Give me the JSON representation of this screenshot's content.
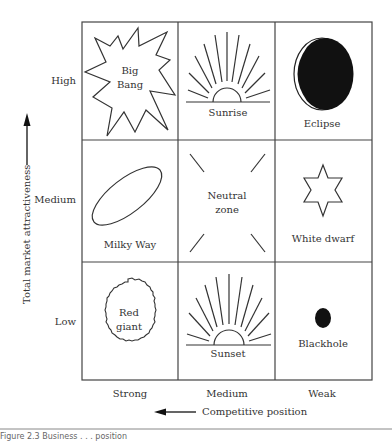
{
  "diagram": {
    "y_axis": {
      "title": "Total market attractiveness",
      "levels": [
        "High",
        "Medium",
        "Low"
      ]
    },
    "x_axis": {
      "title": "Competitive position",
      "levels": [
        "Strong",
        "Medium",
        "Weak"
      ]
    },
    "cells": [
      {
        "row": "High",
        "col": "Strong",
        "label_line1": "Big",
        "label_line2": "Bang",
        "icon": "starburst-icon"
      },
      {
        "row": "High",
        "col": "Medium",
        "label": "Sunrise",
        "icon": "sunrise-icon"
      },
      {
        "row": "High",
        "col": "Weak",
        "label": "Eclipse",
        "icon": "eclipse-icon"
      },
      {
        "row": "Medium",
        "col": "Strong",
        "label": "Milky Way",
        "icon": "ellipse-galaxy-icon"
      },
      {
        "row": "Medium",
        "col": "Medium",
        "label_line1": "Neutral",
        "label_line2": "zone",
        "icon": "neutral-lines-icon"
      },
      {
        "row": "Medium",
        "col": "Weak",
        "label": "White dwarf",
        "icon": "six-point-star-icon"
      },
      {
        "row": "Low",
        "col": "Strong",
        "label_line1": "Red",
        "label_line2": "giant",
        "icon": "rough-circle-icon"
      },
      {
        "row": "Low",
        "col": "Medium",
        "label": "Sunset",
        "icon": "sunset-icon"
      },
      {
        "row": "Low",
        "col": "Weak",
        "label": "Blackhole",
        "icon": "black-dot-icon"
      }
    ]
  },
  "caption": "Figure 2.3   Business . . . position"
}
